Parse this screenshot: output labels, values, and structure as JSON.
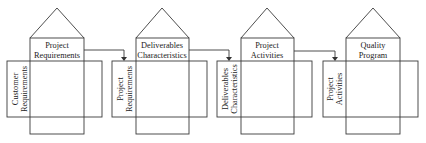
{
  "diagram": {
    "type": "house-of-quality-cascade",
    "stroke_color": "#3a3a3a",
    "houses": [
      {
        "id": "h1",
        "roof_title": [
          "Project",
          "Requirements"
        ],
        "side_label": [
          "Customer",
          "Requirements"
        ],
        "x": 30,
        "w": 54,
        "rect_x": 7,
        "rect_w": 95,
        "side_w": 23
      },
      {
        "id": "h2",
        "roof_title": [
          "Deliverables",
          "Characteristics"
        ],
        "side_label": [
          "Project",
          "Requirements"
        ],
        "x": 136,
        "w": 53,
        "rect_x": 112,
        "rect_w": 95,
        "side_w": 24
      },
      {
        "id": "h3",
        "roof_title": [
          "Project",
          "Activities"
        ],
        "side_label": [
          "Deliverables",
          "Characteristics"
        ],
        "x": 241,
        "w": 53,
        "rect_x": 217,
        "rect_w": 95,
        "side_w": 24
      },
      {
        "id": "h4",
        "roof_title": [
          "Quality",
          "Program"
        ],
        "side_label": [
          "Project",
          "Activities"
        ],
        "x": 346,
        "w": 54,
        "rect_x": 323,
        "rect_w": 95,
        "side_w": 23
      }
    ],
    "arrows": [
      {
        "from": "h1",
        "to": "h2"
      },
      {
        "from": "h2",
        "to": "h3"
      },
      {
        "from": "h3",
        "to": "h4"
      }
    ]
  }
}
